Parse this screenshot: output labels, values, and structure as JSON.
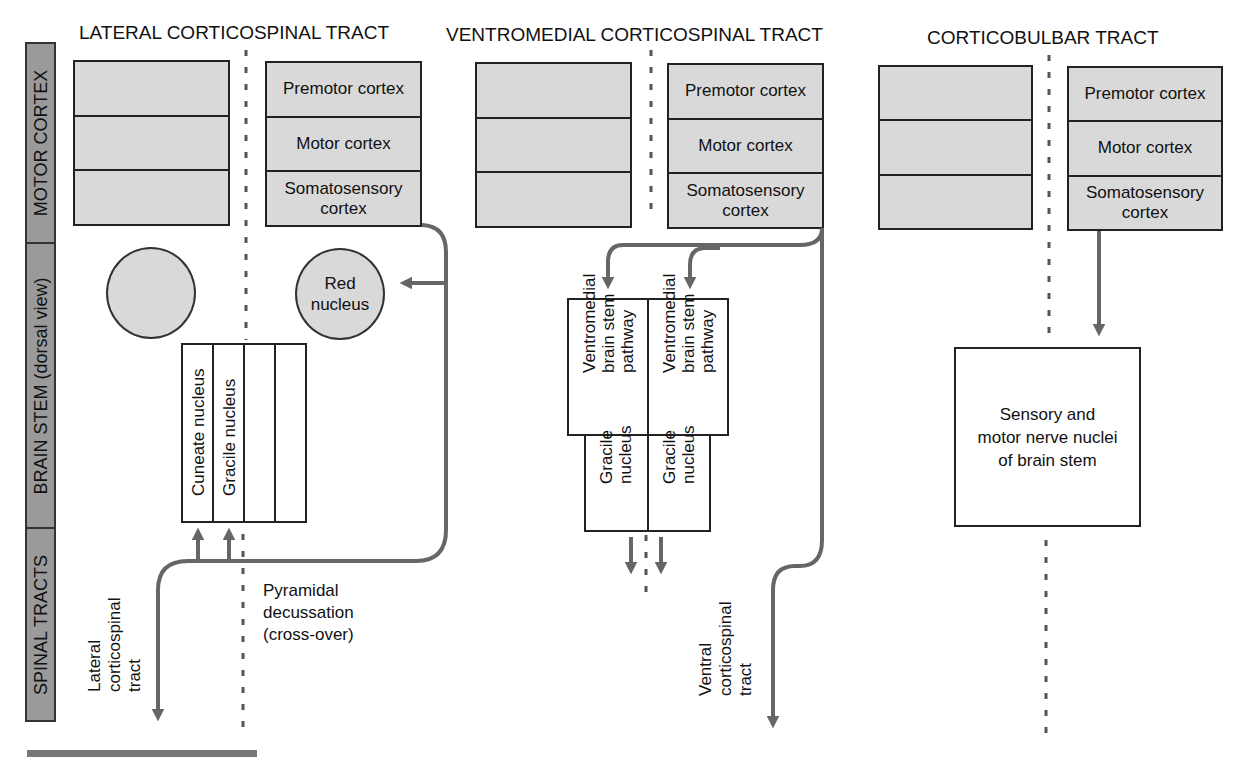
{
  "sidebar": {
    "sections": [
      {
        "label": "MOTOR CORTEX"
      },
      {
        "label": "BRAIN STEM (dorsal view)"
      },
      {
        "label": "SPINAL TRACTS"
      }
    ]
  },
  "panels": [
    {
      "title": "LATERAL CORTICOSPINAL TRACT",
      "cortex_left_layers": [
        "",
        "",
        ""
      ],
      "cortex_right_layers": [
        "Premotor cortex",
        "Motor cortex",
        "Somatosensory cortex"
      ],
      "red_nucleus": "Red nucleus",
      "dorsal_column_nuclei": [
        "Cuneate nucleus",
        "Gracile nucleus",
        "",
        ""
      ],
      "decussation_label": [
        "Pyramidal",
        "decussation",
        "(cross-over)"
      ],
      "tract_label": [
        "Lateral",
        "corticospinal",
        "tract"
      ]
    },
    {
      "title": "VENTROMEDIAL CORTICOSPINAL TRACT",
      "cortex_left_layers": [
        "",
        "",
        ""
      ],
      "cortex_right_layers": [
        "Premotor cortex",
        "Motor cortex",
        "Somatosensory cortex"
      ],
      "pathways": [
        "Ventromedial brain stem pathway",
        "Ventromedial brain stem pathway"
      ],
      "nuclei": [
        "Gracile nucleus",
        "Gracile nucleus"
      ],
      "tract_label": [
        "Ventral",
        "corticospinal",
        "tract"
      ]
    },
    {
      "title": "CORTICOBULBAR TRACT",
      "cortex_left_layers": [
        "",
        "",
        ""
      ],
      "cortex_right_layers": [
        "Premotor cortex",
        "Motor cortex",
        "Somatosensory cortex"
      ],
      "target": "Sensory and motor nerve nuclei of brain stem"
    }
  ],
  "colors": {
    "fill_gray": "#d9d9d9",
    "arrow_gray": "#666666",
    "sidebar_gray": "#9a9a9a"
  }
}
